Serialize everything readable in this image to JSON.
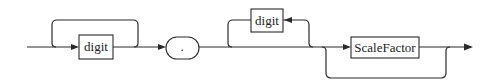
{
  "diagram": {
    "type": "syntax-diagram",
    "nodes": [
      {
        "id": "digit1",
        "label": "digit",
        "kind": "nonterminal",
        "repeatable": true
      },
      {
        "id": "dot",
        "label": ".",
        "kind": "terminal"
      },
      {
        "id": "digit2",
        "label": "digit",
        "kind": "nonterminal",
        "repeatable": true,
        "optional": true
      },
      {
        "id": "scale",
        "label": "ScaleFactor",
        "kind": "nonterminal",
        "optional": true
      }
    ],
    "colors": {
      "stroke": "#2a2a2a",
      "background": "#ffffff"
    }
  }
}
